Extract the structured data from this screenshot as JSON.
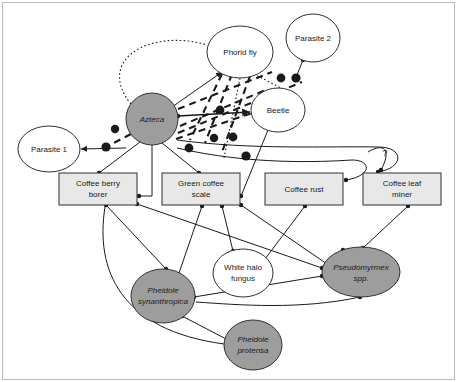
{
  "diagram": {
    "type": "network-diagram",
    "frame_color": "#b9b9b9",
    "background": "#ffffff",
    "fill_shaded": "#9d9d9d",
    "fill_white": "#ffffff",
    "fill_box": "#e8e8e8",
    "stroke_color": "#303030",
    "annotation": "?"
  },
  "nodes": [
    {
      "id": "phorid_fly",
      "label": "Phorid fly",
      "shape": "ellipse",
      "style": "white",
      "italic": false,
      "cx": 240,
      "cy": 52,
      "rx": 33,
      "ry": 26
    },
    {
      "id": "parasite_2",
      "label": "Parasite 2",
      "shape": "ellipse",
      "style": "white",
      "italic": false,
      "cx": 313,
      "cy": 38,
      "rx": 27,
      "ry": 24
    },
    {
      "id": "azteca",
      "label": "Azteca",
      "shape": "ellipse",
      "style": "shaded",
      "italic": true,
      "cx": 152,
      "cy": 119,
      "rx": 26,
      "ry": 26
    },
    {
      "id": "beetle",
      "label": "Beetle",
      "shape": "ellipse",
      "style": "white",
      "italic": false,
      "cx": 278,
      "cy": 110,
      "rx": 27,
      "ry": 22
    },
    {
      "id": "parasite_1",
      "label": "Parasite  1",
      "shape": "ellipse",
      "style": "white",
      "italic": false,
      "cx": 49,
      "cy": 149,
      "rx": 31,
      "ry": 23
    },
    {
      "id": "coffee_berry_borer",
      "label": "Coffee berry borer",
      "shape": "box",
      "style": "box",
      "italic": false,
      "x": 59,
      "y": 173,
      "w": 78,
      "h": 32
    },
    {
      "id": "green_coffee_scale",
      "label": "Green coffee scale",
      "shape": "box",
      "style": "box",
      "italic": false,
      "x": 162,
      "y": 173,
      "w": 78,
      "h": 32
    },
    {
      "id": "coffee_rust",
      "label": "Coffee rust",
      "shape": "box",
      "style": "box",
      "italic": false,
      "x": 265,
      "y": 173,
      "w": 78,
      "h": 32
    },
    {
      "id": "coffee_leaf_miner",
      "label": "Coffee leaf miner",
      "shape": "box",
      "style": "box",
      "italic": false,
      "x": 363,
      "y": 173,
      "w": 78,
      "h": 32
    },
    {
      "id": "white_halo_fungus",
      "label": "White halo fungus",
      "shape": "ellipse",
      "style": "white",
      "italic": false,
      "cx": 243,
      "cy": 273,
      "rx": 30,
      "ry": 24
    },
    {
      "id": "pseudomyrmex",
      "label": "Pseudomyrmex spp.",
      "shape": "ellipse",
      "style": "shaded",
      "italic": true,
      "cx": 361,
      "cy": 272,
      "rx": 39,
      "ry": 25
    },
    {
      "id": "pheidole_syn",
      "label": "Pheidole synanthropica",
      "shape": "ellipse",
      "style": "shaded",
      "italic": true,
      "cx": 163,
      "cy": 296,
      "rx": 32,
      "ry": 27
    },
    {
      "id": "pheidole_pro",
      "label": "Pheidole protensa",
      "shape": "ellipse",
      "style": "shaded",
      "italic": true,
      "cx": 253,
      "cy": 345,
      "rx": 29,
      "ry": 25
    }
  ],
  "node_label_lines": {
    "phorid_fly": [
      "Phorid fly"
    ],
    "parasite_2": [
      "Parasite 2"
    ],
    "azteca": [
      "Azteca"
    ],
    "beetle": [
      "Beetle"
    ],
    "parasite_1": [
      "Parasite  1"
    ],
    "coffee_berry_borer": [
      "Coffee berry",
      "borer"
    ],
    "green_coffee_scale": [
      "Green coffee",
      "scale"
    ],
    "coffee_rust": [
      "Coffee rust"
    ],
    "coffee_leaf_miner": [
      "Coffee leaf",
      "miner"
    ],
    "white_halo_fungus": [
      "White halo",
      "fungus"
    ],
    "pseudomyrmex": [
      "Pseudomyrmex",
      "spp."
    ],
    "pheidole_syn": [
      "Pheidole",
      "synanthropica"
    ],
    "pheidole_pro": [
      "Pheidole",
      "protensa"
    ]
  },
  "edges": [
    {
      "from": "azteca",
      "to": "phorid_fly",
      "line": "dotted-curve",
      "endpoint": "big-dot"
    },
    {
      "from": "phorid_fly",
      "to": "azteca",
      "line": "solid",
      "endpoint": "arrow"
    },
    {
      "from": "phorid_fly",
      "to": "green_coffee_scale",
      "line": "dotted",
      "endpoint": "dot"
    },
    {
      "from": "phorid_fly",
      "to": "beetle",
      "line": "dashed",
      "endpoint": "big-dot"
    },
    {
      "from": "parasite_2",
      "to": "beetle",
      "line": "solid",
      "endpoint": "dot"
    },
    {
      "from": "azteca",
      "to": "beetle",
      "line": "solid",
      "endpoint": "arrow"
    },
    {
      "from": "azteca",
      "to": "beetle",
      "line": "dashed",
      "endpoint": "big-dot"
    },
    {
      "from": "azteca",
      "to": "parasite_1",
      "line": "dashed",
      "endpoint": "big-dot"
    },
    {
      "from": "azteca",
      "to": "parasite_1",
      "line": "solid",
      "endpoint": "arrow"
    },
    {
      "from": "azteca",
      "to": "coffee_berry_borer",
      "line": "solid",
      "endpoint": "dot"
    },
    {
      "from": "azteca",
      "to": "green_coffee_scale",
      "line": "solid",
      "endpoint": "dot"
    },
    {
      "from": "azteca",
      "to": "coffee_leaf_miner",
      "line": "solid-curve",
      "endpoint": "dot"
    },
    {
      "from": "azteca",
      "to": "pseudomyrmex",
      "line": "solid-curve",
      "endpoint": "dot"
    },
    {
      "from": "beetle",
      "to": "green_coffee_scale",
      "line": "solid",
      "endpoint": "dot"
    },
    {
      "from": "coffee_berry_borer",
      "to": "pheidole_syn",
      "line": "solid",
      "endpoint": "dot"
    },
    {
      "from": "coffee_berry_borer",
      "to": "pheidole_pro",
      "line": "solid-curve",
      "endpoint": "dot"
    },
    {
      "from": "coffee_berry_borer",
      "to": "pseudomyrmex",
      "line": "solid",
      "endpoint": "dot"
    },
    {
      "from": "green_coffee_scale",
      "to": "pheidole_syn",
      "line": "solid",
      "endpoint": "dot"
    },
    {
      "from": "green_coffee_scale",
      "to": "white_halo_fungus",
      "line": "solid",
      "endpoint": "dot"
    },
    {
      "from": "green_coffee_scale",
      "to": "pseudomyrmex",
      "line": "solid",
      "endpoint": "dot"
    },
    {
      "from": "coffee_rust",
      "to": "white_halo_fungus",
      "line": "solid",
      "endpoint": "dot"
    },
    {
      "from": "coffee_leaf_miner",
      "to": "pseudomyrmex",
      "line": "solid",
      "endpoint": "dot"
    },
    {
      "from": "pheidole_syn",
      "to": "pseudomyrmex",
      "line": "solid",
      "endpoint": "dot"
    },
    {
      "from": "pheidole_syn",
      "to": "pheidole_pro",
      "line": "solid",
      "endpoint": "dot"
    },
    {
      "from": "coffee_leaf_miner",
      "to": "unknown",
      "line": "solid-curve",
      "endpoint": "dot",
      "label": "?"
    }
  ]
}
